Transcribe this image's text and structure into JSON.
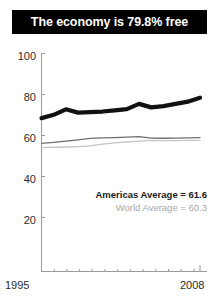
{
  "title": {
    "text": "The economy is 79.8% free"
  },
  "legend": {
    "americas": "Americas Average = 61.6",
    "world": "World Average = 60.3"
  },
  "axis": {
    "y_ticks": [
      "100",
      "80",
      "60",
      "40",
      "20"
    ],
    "x_ticks": [
      "1995",
      "2008"
    ]
  },
  "colors": {
    "banner_bg": "#000000",
    "banner_text": "#ffffff",
    "country_line": "#111111",
    "americas_line": "#6e6e6e",
    "world_line": "#c4c4c4",
    "axis": "#9a9a9a",
    "tick_text": "#2b2b2b"
  },
  "chart_data": {
    "type": "line",
    "title": "The economy is 79.8% free",
    "xlabel": "",
    "ylabel": "",
    "xlim": [
      1995,
      2008
    ],
    "ylim": [
      0,
      100
    ],
    "grid": false,
    "legend_position": "inside-lower-right",
    "x": [
      1995,
      1996,
      1997,
      1998,
      1999,
      2000,
      2001,
      2002,
      2003,
      2004,
      2005,
      2006,
      2007,
      2008
    ],
    "series": [
      {
        "name": "Country score",
        "style": "thick-black",
        "values": [
          70.5,
          72.0,
          74.5,
          73.0,
          73.2,
          73.5,
          74.0,
          74.6,
          77.0,
          75.4,
          76.0,
          77.0,
          78.0,
          79.8
        ]
      },
      {
        "name": "Americas Average",
        "style": "medium-gray",
        "values": [
          59.0,
          59.4,
          60.0,
          60.6,
          61.2,
          61.5,
          61.6,
          61.8,
          62.0,
          61.4,
          61.3,
          61.4,
          61.5,
          61.6
        ]
      },
      {
        "name": "World Average",
        "style": "light-gray",
        "values": [
          57.0,
          57.2,
          57.3,
          57.5,
          57.8,
          58.6,
          59.2,
          59.6,
          60.0,
          60.3,
          60.2,
          60.2,
          60.3,
          60.3
        ]
      }
    ],
    "annotations": [
      {
        "text": "Americas Average = 61.6",
        "value": 61.6
      },
      {
        "text": "World Average = 60.3",
        "value": 60.3
      }
    ]
  }
}
